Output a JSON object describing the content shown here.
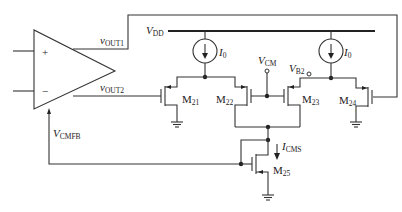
{
  "diagram": {
    "type": "circuit-schematic",
    "opamp": {
      "plus_label": "+",
      "minus_label": "−",
      "output1_label": {
        "main": "v",
        "sub": "OUT1"
      },
      "output2_label": {
        "main": "v",
        "sub": "OUT2"
      },
      "cmfb_label": {
        "main": "V",
        "sub": "CMFB"
      }
    },
    "supply": {
      "main": "V",
      "sub": "DD"
    },
    "current_sources": [
      {
        "id": "I0-left",
        "main": "I",
        "sub": "0"
      },
      {
        "id": "I0-right",
        "main": "I",
        "sub": "0"
      }
    ],
    "bias_nodes": [
      {
        "id": "VCM",
        "main": "V",
        "sub": "CM"
      },
      {
        "id": "VB2",
        "main": "V",
        "sub": "B2"
      }
    ],
    "transistors": [
      {
        "id": "M21",
        "main": "M",
        "sub": "21",
        "type": "PMOS"
      },
      {
        "id": "M22",
        "main": "M",
        "sub": "22",
        "type": "PMOS"
      },
      {
        "id": "M23",
        "main": "M",
        "sub": "23",
        "type": "PMOS"
      },
      {
        "id": "M24",
        "main": "M",
        "sub": "24",
        "type": "PMOS"
      },
      {
        "id": "M25",
        "main": "M",
        "sub": "25",
        "type": "NMOS"
      }
    ],
    "current_label": {
      "main": "I",
      "sub": "CMS"
    }
  }
}
